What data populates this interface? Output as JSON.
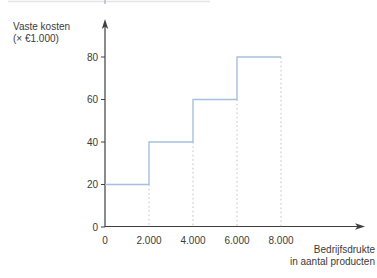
{
  "figure": {
    "background": "#ffffff"
  },
  "decor": {
    "cropped_top_rule_color": "#e4e4e8",
    "cropped_top_tick_color": "#9aa0a6"
  },
  "chart_data": {
    "type": "step",
    "title": "",
    "ylabel": "Vaste kosten (× €1.000)",
    "xlabel": "Bedrijfsdrukte in aantal producten",
    "ylabel_lines": [
      "Vaste kosten",
      "(× €1.000)"
    ],
    "xlabel_lines": [
      "Bedrijfsdrukte",
      "in aantal producten"
    ],
    "x_breakpoints": [
      0,
      2000,
      4000,
      6000,
      8000
    ],
    "segment_values": [
      20,
      40,
      60,
      80
    ],
    "x_tick_labels": [
      "0",
      "2.000",
      "4.000",
      "6.000",
      "8.000"
    ],
    "y_ticks": [
      0,
      20,
      40,
      60,
      80
    ],
    "xlim": [
      0,
      11700
    ],
    "ylim": [
      0,
      97
    ],
    "grid": false,
    "legend": null,
    "line_color": "#a5c0dd",
    "dash_color": "#bfbfbf",
    "axis_color": "#3f3f3f",
    "text_color": "#3a3a3a"
  }
}
